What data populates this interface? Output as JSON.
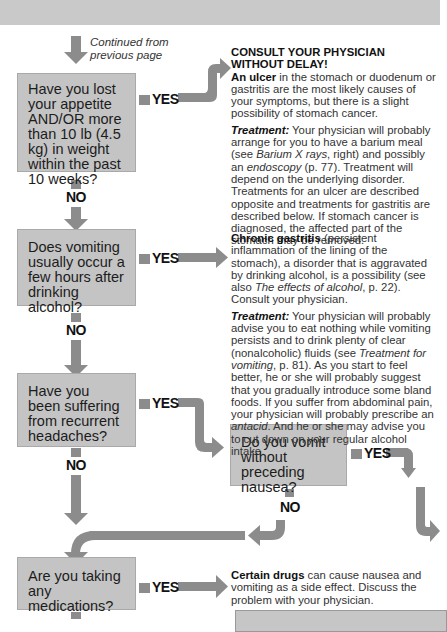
{
  "continued": "Continued from previous page",
  "questions": [
    {
      "id": "q1",
      "text": "Have you lost your appetite AND/OR more than 10 lb (4.5 kg) in weight within the past 10 weeks?",
      "yes": "YES",
      "no": "NO"
    },
    {
      "id": "q2",
      "text": "Does vomiting usually occur a few hours after drinking alcohol?",
      "yes": "YES",
      "no": "NO"
    },
    {
      "id": "q3",
      "text": "Have you been suffering from recurrent headaches?",
      "yes": "YES",
      "no": "NO"
    },
    {
      "id": "q4",
      "text": "Do you vomit without preceding nausea?",
      "yes": "YES",
      "no": "NO"
    },
    {
      "id": "q5",
      "text": "Are you taking any medications?",
      "yes": "YES"
    }
  ],
  "answers": {
    "a1": {
      "title": "CONSULT YOUR PHYSICIAN WITHOUT DELAY!",
      "lead_bold": "An ulcer",
      "lead_rest": " in the stomach or duodenum or gastritis are the most likely causes of your symptoms, but there is a slight possibility of stomach cancer.",
      "treatment_label": "Treatment:",
      "treatment_1": " Your physician will probably arrange for you to have a barium meal (see ",
      "treatment_link1": "Barium X rays",
      "treatment_2": ", right) and possibly an ",
      "treatment_link2": "endoscopy",
      "treatment_3": " (p. 77). Treatment will depend on the underlying disorder. Treatments for an ulcer are described opposite and treatments for gastritis are described below. If stomach cancer is diagnosed, the affected part of the stomach may be removed."
    },
    "a2": {
      "lead_bold": "Chronic gastritis",
      "lead_rest": " (persistent inflammation of the lining of the stomach), a disorder that is aggravated by drinking alcohol, is a possibility (see also ",
      "lead_link": "The effects of alcohol",
      "lead_end": ", p. 22). Consult your physician.",
      "treatment_label": "Treatment:",
      "treatment_1": " Your physician will probably advise you to eat nothing while vomiting persists and to drink plenty of clear (nonalcoholic) fluids (see ",
      "treatment_link1": "Treatment for vomiting",
      "treatment_2": ", p. 81). As you start to feel better, he or she will probably suggest that you gradually introduce some bland foods. If you suffer from abdominal pain, your physician will probably prescribe an ",
      "treatment_link2": "antacid",
      "treatment_3": ". And he or she may advise you to cut down on your regular alcohol intake."
    },
    "a5": {
      "lead_bold": "Certain drugs",
      "lead_rest": " can cause nausea and vomiting as a side effect. Discuss the problem with your physician."
    }
  },
  "colors": {
    "box": "#c4c4c4",
    "arrow": "#8c8c8c",
    "topbar": "#c9c9c9"
  }
}
